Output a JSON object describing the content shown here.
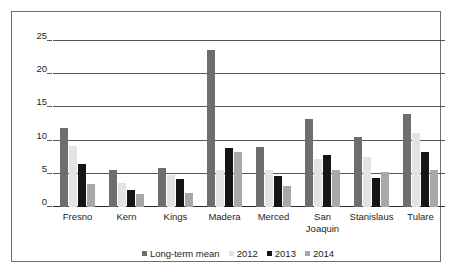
{
  "chart_data": {
    "type": "bar",
    "title": "",
    "subtitle": "",
    "xlabel": "",
    "ylabel": "",
    "ylim": [
      0,
      25
    ],
    "yticks": [
      0,
      5,
      10,
      15,
      20,
      25
    ],
    "grid": true,
    "legend_position": "bottom",
    "categories": [
      "Fresno",
      "Kern",
      "Kings",
      "Madera",
      "Merced",
      "San Joaquin",
      "Stanislaus",
      "Tulare"
    ],
    "category_lines": [
      [
        "Fresno"
      ],
      [
        "Kern"
      ],
      [
        "Kings"
      ],
      [
        "Madera"
      ],
      [
        "Merced"
      ],
      [
        "San",
        "Joaquin"
      ],
      [
        "Stanislaus"
      ],
      [
        "Tulare"
      ]
    ],
    "series": [
      {
        "name": "Long-term mean",
        "color": "#6d6e70",
        "values": [
          11.9,
          5.6,
          5.9,
          23.6,
          9.0,
          13.3,
          10.5,
          14.0
        ]
      },
      {
        "name": "2012",
        "color": "#e2e3e4",
        "values": [
          9.2,
          3.6,
          4.8,
          5.6,
          5.5,
          7.3,
          7.5,
          11.2
        ]
      },
      {
        "name": "2013",
        "color": "#151515",
        "values": [
          6.5,
          2.5,
          4.2,
          8.9,
          4.6,
          7.9,
          4.4,
          8.3
        ]
      },
      {
        "name": "2014",
        "color": "#a6a8ab",
        "values": [
          3.4,
          1.9,
          2.1,
          8.3,
          3.2,
          5.6,
          5.3,
          5.6
        ]
      }
    ]
  },
  "axis": {
    "ytick_labels": [
      "0",
      "5",
      "10",
      "15",
      "20",
      "25"
    ]
  },
  "legend": {
    "entries": [
      {
        "label": "Long-term mean"
      },
      {
        "label": "2012"
      },
      {
        "label": "2013"
      },
      {
        "label": "2014"
      }
    ]
  },
  "colors": {
    "frame": "#6e6e6e",
    "gridline": "#58585a",
    "baseline": "#2b2b2b",
    "text": "#231f20",
    "background": "#ffffff"
  }
}
